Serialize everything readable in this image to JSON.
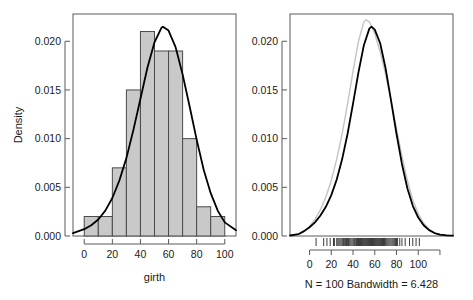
{
  "chart_data": [
    {
      "type": "bar",
      "panel": "left",
      "title": "",
      "xlabel": "girth",
      "ylabel": "Density",
      "xlim": [
        -8,
        108
      ],
      "ylim": [
        0.0,
        0.0228
      ],
      "xticks": [
        0,
        20,
        40,
        60,
        80,
        100
      ],
      "xtick_labels": [
        "0",
        "20",
        "40",
        "60",
        "80",
        "100"
      ],
      "yticks": [
        0.0,
        0.005,
        0.01,
        0.015,
        0.02
      ],
      "ytick_labels": [
        "0.000",
        "0.005",
        "0.010",
        "0.015",
        "0.020"
      ],
      "grid": false,
      "legend": "none",
      "bin_edges": [
        0,
        10,
        20,
        30,
        40,
        50,
        60,
        70,
        80,
        90,
        100
      ],
      "bin_centers": [
        5,
        15,
        25,
        35,
        45,
        55,
        65,
        75,
        85,
        95
      ],
      "values": [
        0.002,
        0.002,
        0.007,
        0.015,
        0.021,
        0.019,
        0.019,
        0.01,
        0.003,
        0.002
      ],
      "bar_fill": "#c9c9c9",
      "bar_edge": "#4a4a4a",
      "overlay_curve": {
        "name": "normal density",
        "color": "#000000",
        "peak_x": 56,
        "peak_y": 0.0215,
        "mean": 56,
        "sd": 18.6,
        "x": [
          -8,
          0,
          5,
          10,
          15,
          20,
          25,
          30,
          35,
          40,
          45,
          50,
          55,
          56,
          60,
          65,
          70,
          75,
          80,
          85,
          90,
          95,
          100,
          108
        ],
        "y": [
          0.0003,
          0.0007,
          0.0011,
          0.0017,
          0.0026,
          0.0039,
          0.0057,
          0.008,
          0.0109,
          0.0141,
          0.0173,
          0.0199,
          0.0214,
          0.0215,
          0.0211,
          0.0194,
          0.0166,
          0.0133,
          0.0099,
          0.0068,
          0.0044,
          0.0026,
          0.0014,
          0.0006
        ]
      }
    },
    {
      "type": "line",
      "panel": "right",
      "title": "",
      "xlabel": "N = 100   Bandwidth = 6.428",
      "ylabel": "",
      "xlim": [
        -18,
        132
      ],
      "ylim": [
        0.0,
        0.0228
      ],
      "xticks": [
        0,
        20,
        40,
        60,
        80,
        100,
        120
      ],
      "xtick_labels": [
        "0",
        "20",
        "40",
        "60",
        "80",
        "100",
        ""
      ],
      "yticks": [
        0.0,
        0.005,
        0.01,
        0.015,
        0.02
      ],
      "ytick_labels": [
        "0.000",
        "0.005",
        "0.010",
        "0.015",
        "0.020"
      ],
      "grid": false,
      "legend": "none",
      "series": [
        {
          "name": "kernel density estimate",
          "color": "#000000",
          "peak_x": 57,
          "peak_y": 0.0215,
          "x": [
            -18,
            -10,
            -5,
            0,
            5,
            10,
            15,
            20,
            25,
            30,
            35,
            40,
            45,
            50,
            55,
            57,
            60,
            65,
            70,
            75,
            80,
            85,
            90,
            95,
            100,
            105,
            110,
            115,
            120,
            126,
            132
          ],
          "y": [
            5e-05,
            0.0002,
            0.0005,
            0.0009,
            0.0014,
            0.0021,
            0.003,
            0.0042,
            0.0058,
            0.0079,
            0.0105,
            0.0136,
            0.0168,
            0.0196,
            0.0213,
            0.0215,
            0.0212,
            0.0198,
            0.0172,
            0.0139,
            0.0105,
            0.0074,
            0.0049,
            0.0031,
            0.0019,
            0.0011,
            0.0006,
            0.0003,
            0.00015,
            7e-05,
            3e-05
          ]
        },
        {
          "name": "reference density",
          "color": "#c4c4c4",
          "peak_x": 52,
          "peak_y": 0.0222,
          "x": [
            -18,
            -10,
            -5,
            0,
            5,
            10,
            15,
            20,
            25,
            30,
            35,
            40,
            45,
            50,
            52,
            55,
            60,
            65,
            70,
            75,
            80,
            85,
            90,
            95,
            100,
            105,
            110,
            115,
            120,
            126,
            132
          ],
          "y": [
            5e-05,
            0.0002,
            0.0005,
            0.001,
            0.0017,
            0.0027,
            0.004,
            0.0057,
            0.0079,
            0.0105,
            0.0136,
            0.0169,
            0.02,
            0.022,
            0.0222,
            0.022,
            0.0208,
            0.0189,
            0.0166,
            0.0139,
            0.011,
            0.0082,
            0.0057,
            0.0037,
            0.0023,
            0.0013,
            0.0007,
            0.0003,
            0.00015,
            7e-05,
            3e-05
          ]
        }
      ],
      "rug": {
        "name": "data rug marks",
        "color": "#3c3c3c",
        "values": [
          6,
          13,
          16,
          19,
          22,
          23,
          25,
          26,
          27,
          28,
          29,
          30,
          31,
          32,
          33,
          34,
          35,
          36,
          37,
          38,
          39,
          40,
          41,
          42,
          43,
          44,
          45,
          46,
          47,
          48,
          49,
          50,
          51,
          52,
          53,
          54,
          55,
          56,
          57,
          58,
          59,
          60,
          61,
          62,
          63,
          64,
          65,
          66,
          67,
          68,
          69,
          70,
          71,
          72,
          73,
          74,
          75,
          76,
          77,
          78,
          79,
          80,
          81,
          83,
          85,
          88,
          92,
          95,
          98,
          101,
          31,
          36,
          41,
          44,
          47,
          49,
          51,
          53,
          55,
          57,
          59,
          61,
          63,
          65,
          67,
          69,
          43,
          46,
          50,
          54,
          58,
          62,
          66,
          48,
          52,
          56,
          60,
          64,
          45,
          68
        ]
      }
    }
  ],
  "labels": {
    "left_ylabel": "Density",
    "left_xlabel": "girth",
    "right_caption": "N = 100   Bandwidth = 6.428",
    "ytick_labels": [
      "0.000",
      "0.005",
      "0.010",
      "0.015",
      "0.020"
    ],
    "left_xtick_labels": [
      "0",
      "20",
      "40",
      "60",
      "80",
      "100"
    ],
    "right_xtick_labels": [
      "0",
      "20",
      "40",
      "60",
      "80",
      "100"
    ]
  },
  "colors": {
    "axis": "#5a5a5a",
    "text": "#1a1a1a",
    "bar_fill": "#c9c9c9",
    "bar_edge": "#4a4a4a",
    "curve_primary": "#000000",
    "curve_secondary": "#c4c4c4",
    "rug": "#3c3c3c",
    "background": "#ffffff"
  }
}
